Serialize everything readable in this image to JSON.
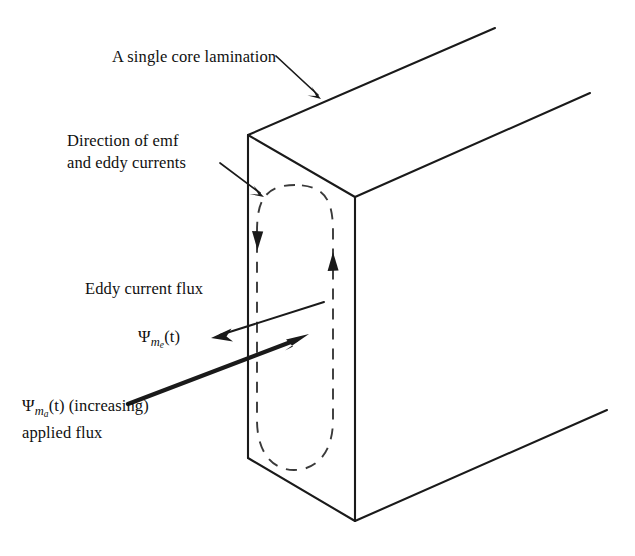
{
  "figure": {
    "title_alt": "Eddy currents in a single core lamination",
    "background_color": "#ffffff",
    "line_color": "#1a1a1a",
    "dash_color": "#3a3a3a"
  },
  "labels": {
    "lamination": "A single core lamination",
    "direction_line1": "Direction of emf",
    "direction_line2": "and eddy currents",
    "eddy_current_flux": "Eddy current flux",
    "psi_symbol": "Ψ",
    "psi_e": {
      "symbol": "Ψ",
      "sub_main": "m",
      "sub_sub": "e",
      "arg": "(t)"
    },
    "psi_a": {
      "symbol": "Ψ",
      "sub_main": "m",
      "sub_sub": "a",
      "arg": "(t)",
      "qualifier": "(increasing)",
      "line2": "applied flux"
    }
  },
  "geometry": {
    "front_face": {
      "top_left": [
        248,
        135
      ],
      "top_right": [
        355,
        197
      ],
      "bottom_right": [
        355,
        521
      ],
      "bottom_left": [
        248,
        458
      ]
    },
    "top_face": {
      "near_left": [
        248,
        135
      ],
      "near_right": [
        355,
        197
      ],
      "far_right": [
        590,
        93
      ],
      "far_left": [
        495,
        28
      ]
    },
    "right_face": {
      "near_top": [
        355,
        197
      ],
      "near_bottom": [
        355,
        521
      ],
      "far_bottom": [
        607,
        410
      ],
      "far_top": [
        590,
        93
      ]
    },
    "eddy_loop": {
      "left": 258,
      "right": 332,
      "top": 185,
      "bottom": 470
    },
    "arrows": {
      "lamination_pointer": {
        "from": [
          278,
          58
        ],
        "to": [
          320,
          97
        ]
      },
      "direction_pointer": {
        "from": [
          222,
          165
        ],
        "to": [
          263,
          196
        ]
      },
      "eddy_flux_thin": {
        "from": [
          322,
          303
        ],
        "to": [
          212,
          338
        ]
      },
      "applied_flux_bold": {
        "from": [
          128,
          404
        ],
        "to": [
          305,
          336
        ]
      }
    },
    "loop_arrowheads": {
      "left_down": [
        262,
        243
      ],
      "right_up": [
        332,
        260
      ]
    }
  }
}
